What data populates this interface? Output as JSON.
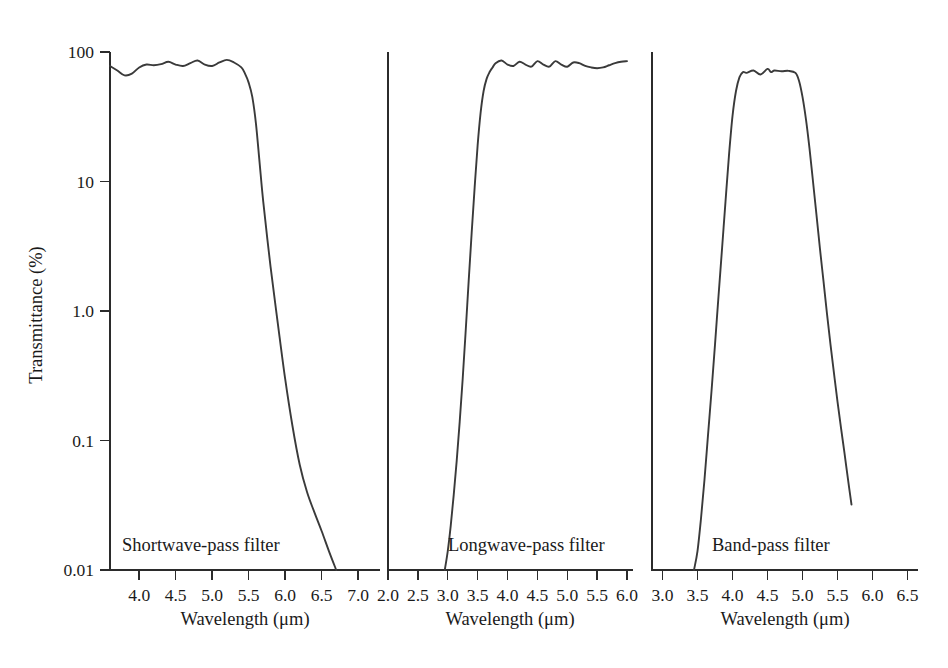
{
  "figure": {
    "title": "",
    "background_color": "#ffffff",
    "curve_color": "#3a3a3a",
    "axis_color": "#2b2b2b",
    "shared_ylabel": "Transmittance (%)",
    "shared_xlabel": "Wavelength (μm)"
  },
  "chart_data": [
    {
      "type": "line",
      "title": "",
      "annotation": "Shortwave-pass filter",
      "xlabel": "Wavelength (μm)",
      "ylabel": "Transmittance (%)",
      "yscale": "log",
      "ylim": [
        0.01,
        100
      ],
      "yticks": [
        100,
        10,
        1.0,
        0.1,
        0.01
      ],
      "ytick_labels": [
        "100",
        "10",
        "1.0",
        "0.1",
        "0.01"
      ],
      "xlim": [
        3.6,
        7.3
      ],
      "xticks": [
        4.0,
        4.5,
        5.0,
        5.5,
        6.0,
        6.5,
        7.0
      ],
      "xtick_labels": [
        "4.0",
        "4.5",
        "5.0",
        "5.5",
        "6.0",
        "6.5",
        "7.0"
      ],
      "grid": false,
      "legend": "none",
      "x": [
        3.6,
        3.7,
        3.8,
        3.9,
        4.0,
        4.1,
        4.2,
        4.3,
        4.4,
        4.5,
        4.6,
        4.7,
        4.8,
        4.9,
        5.0,
        5.1,
        5.2,
        5.3,
        5.4,
        5.45,
        5.5,
        5.55,
        5.6,
        5.65,
        5.7,
        5.8,
        5.9,
        6.0,
        6.1,
        6.2,
        6.3,
        6.4,
        6.5,
        6.6,
        6.7
      ],
      "y": [
        78.0,
        72.0,
        66.0,
        68.0,
        76.0,
        80.0,
        79.0,
        80.5,
        84.0,
        80.0,
        78.0,
        82.0,
        86.0,
        80.0,
        78.0,
        83.0,
        87.0,
        83.0,
        76.0,
        68.0,
        58.0,
        45.0,
        28.0,
        14.0,
        7.0,
        2.2,
        0.8,
        0.3,
        0.13,
        0.065,
        0.04,
        0.028,
        0.02,
        0.014,
        0.01
      ]
    },
    {
      "type": "line",
      "title": "",
      "annotation": "Longwave-pass filter",
      "xlabel": "Wavelength (μm)",
      "ylabel": "Transmittance (%)",
      "yscale": "log",
      "ylim": [
        0.01,
        100
      ],
      "yticks": [
        100,
        10,
        1.0,
        0.1,
        0.01
      ],
      "ytick_labels": [
        "100",
        "10",
        "1.0",
        "0.1",
        "0.01"
      ],
      "xlim": [
        2.0,
        6.1
      ],
      "xticks": [
        2.0,
        2.5,
        3.0,
        3.5,
        4.0,
        4.5,
        5.0,
        5.5,
        6.0
      ],
      "xtick_labels": [
        "2.0",
        "2.5",
        "3.0",
        "3.5",
        "4.0",
        "4.5",
        "5.0",
        "5.5",
        "6.0"
      ],
      "grid": false,
      "legend": "none",
      "x": [
        2.95,
        3.0,
        3.05,
        3.1,
        3.15,
        3.2,
        3.25,
        3.3,
        3.35,
        3.4,
        3.45,
        3.5,
        3.55,
        3.6,
        3.65,
        3.7,
        3.75,
        3.8,
        3.9,
        4.0,
        4.1,
        4.2,
        4.3,
        4.4,
        4.5,
        4.6,
        4.7,
        4.8,
        4.9,
        5.0,
        5.1,
        5.2,
        5.3,
        5.4,
        5.5,
        5.6,
        5.7,
        5.8,
        5.9,
        6.0
      ],
      "y": [
        0.01,
        0.014,
        0.022,
        0.038,
        0.07,
        0.14,
        0.3,
        0.7,
        1.7,
        4.0,
        9.0,
        19.0,
        34.0,
        50.0,
        62.0,
        70.0,
        76.0,
        82.0,
        86.0,
        80.0,
        78.0,
        84.0,
        80.0,
        77.0,
        85.0,
        80.0,
        77.0,
        85.0,
        80.0,
        77.0,
        83.0,
        82.0,
        78.0,
        76.0,
        75.0,
        76.0,
        79.0,
        82.0,
        84.0,
        85.0
      ]
    },
    {
      "type": "line",
      "title": "",
      "annotation": "Band-pass filter",
      "xlabel": "Wavelength (μm)",
      "ylabel": "Transmittance (%)",
      "yscale": "log",
      "ylim": [
        0.01,
        100
      ],
      "yticks": [
        100,
        10,
        1.0,
        0.1,
        0.01
      ],
      "ytick_labels": [
        "100",
        "10",
        "1.0",
        "0.1",
        "0.01"
      ],
      "xlim": [
        2.85,
        6.65
      ],
      "xticks": [
        3.0,
        3.5,
        4.0,
        4.5,
        5.0,
        5.5,
        6.0,
        6.5
      ],
      "xtick_labels": [
        "3.0",
        "3.5",
        "4.0",
        "4.5",
        "5.0",
        "5.5",
        "6.0",
        "6.5"
      ],
      "grid": false,
      "legend": "none",
      "x": [
        3.45,
        3.5,
        3.55,
        3.6,
        3.65,
        3.7,
        3.75,
        3.8,
        3.85,
        3.9,
        3.95,
        4.0,
        4.05,
        4.1,
        4.15,
        4.2,
        4.3,
        4.4,
        4.5,
        4.55,
        4.6,
        4.7,
        4.8,
        4.9,
        4.95,
        5.0,
        5.05,
        5.1,
        5.15,
        5.2,
        5.25,
        5.3,
        5.35,
        5.4,
        5.45,
        5.5,
        5.55,
        5.6,
        5.65,
        5.7
      ],
      "y": [
        0.01,
        0.014,
        0.025,
        0.05,
        0.11,
        0.24,
        0.55,
        1.3,
        3.0,
        7.0,
        16.0,
        32.0,
        50.0,
        64.0,
        70.0,
        69.0,
        72.0,
        67.0,
        74.0,
        70.0,
        72.0,
        71.0,
        71.5,
        69.0,
        60.0,
        45.0,
        30.0,
        18.0,
        10.0,
        5.5,
        3.0,
        1.7,
        0.95,
        0.55,
        0.33,
        0.2,
        0.125,
        0.08,
        0.05,
        0.032
      ]
    }
  ]
}
